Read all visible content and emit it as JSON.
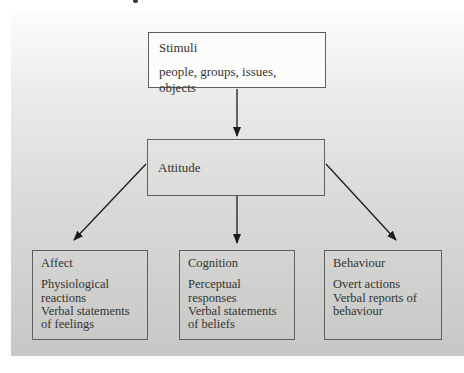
{
  "diagram": {
    "stimuli_box": {
      "title": "Stimuli",
      "description": "people, groups, issues, objects"
    },
    "attitude_box": {
      "title": "Attitude"
    },
    "component_boxes": [
      {
        "title": "Affect",
        "lines": [
          "Physiological reactions",
          "Verbal statements of feelings"
        ]
      },
      {
        "title": "Cognition",
        "lines": [
          "Perceptual responses",
          "Verbal statements of beliefs"
        ]
      },
      {
        "title": "Behaviour",
        "lines": [
          "Overt actions",
          "Verbal reports of behaviour"
        ]
      }
    ],
    "colors": {
      "panel_gradient_top": "#fcfcfb",
      "panel_gradient_bottom": "#c7c7c5",
      "box_border": "#5f5f5d",
      "stimuli_box_fill": "#fcfcfb",
      "arrow": "#1c1c1c",
      "text": "#343432"
    }
  }
}
